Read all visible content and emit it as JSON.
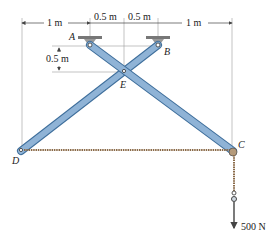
{
  "diagram": {
    "type": "mechanics-frame",
    "points": {
      "A": {
        "label": "A"
      },
      "B": {
        "label": "B"
      },
      "C": {
        "label": "C"
      },
      "D": {
        "label": "D"
      },
      "E": {
        "label": "E"
      }
    },
    "dimensions": {
      "top": [
        "1 m",
        "0.5 m",
        "0.5 m",
        "1 m"
      ],
      "vertical": "0.5 m"
    },
    "load": {
      "label": "500 N"
    },
    "colors": {
      "member_fill": "#8fb3d6",
      "member_stroke": "#3f6f9c",
      "rope": "#8a6a48",
      "dim_line": "#555555",
      "support": "#777777"
    }
  }
}
